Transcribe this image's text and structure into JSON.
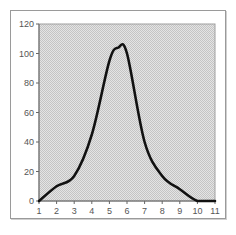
{
  "chart_data": {
    "type": "line",
    "title": "",
    "xlabel": "",
    "ylabel": "",
    "x": [
      1,
      2,
      3,
      4,
      5,
      5.5,
      6,
      7,
      8,
      9,
      10,
      11
    ],
    "series": [
      {
        "name": "Series 1",
        "values": [
          0,
          10,
          17,
          45,
          95,
          104,
          100,
          40,
          17,
          8,
          0,
          0
        ]
      }
    ],
    "xticks": [
      "1",
      "2",
      "3",
      "4",
      "5",
      "6",
      "7",
      "8",
      "9",
      "10",
      "11"
    ],
    "yticks": [
      "0",
      "20",
      "40",
      "60",
      "80",
      "100",
      "120"
    ],
    "xlim": [
      1,
      11
    ],
    "ylim": [
      0,
      120
    ],
    "grid": false,
    "legend": "none",
    "colors": {
      "line": "#111111",
      "plot_bg": "#d9d9d9",
      "frame": "#9a9a9a"
    }
  }
}
